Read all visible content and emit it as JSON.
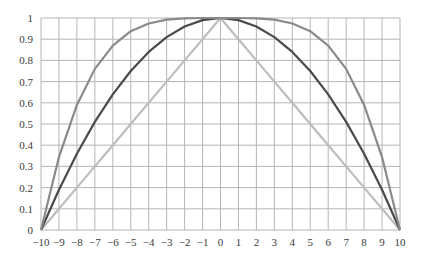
{
  "chart_data": {
    "type": "line",
    "title": "",
    "xlabel": "",
    "ylabel": "",
    "xlim": [
      -10,
      10
    ],
    "ylim": [
      0,
      1
    ],
    "grid": true,
    "legend": null,
    "x": [
      -10,
      -9,
      -8,
      -7,
      -6,
      -5,
      -4,
      -3,
      -2,
      -1,
      0,
      1,
      2,
      3,
      4,
      5,
      6,
      7,
      8,
      9,
      10
    ],
    "x_ticks": [
      "−10",
      "−9",
      "−8",
      "−7",
      "−6",
      "−5",
      "−4",
      "−3",
      "−2",
      "−1",
      "0",
      "1",
      "2",
      "3",
      "4",
      "5",
      "6",
      "7",
      "8",
      "9",
      "10"
    ],
    "y_ticks": [
      "0",
      "0.1",
      "0.2",
      "0.3",
      "0.4",
      "0.5",
      "0.6",
      "0.7",
      "0.8",
      "0.9",
      "1"
    ],
    "series": [
      {
        "name": "outer curve (1 − (x/10)^4)",
        "color": "#8a8a8a",
        "values": [
          0,
          0.344,
          0.59,
          0.76,
          0.87,
          0.938,
          0.974,
          0.992,
          0.998,
          1.0,
          1.0,
          1.0,
          0.998,
          0.992,
          0.974,
          0.938,
          0.87,
          0.76,
          0.59,
          0.344,
          0
        ]
      },
      {
        "name": "middle curve (1 − (x/10)^2)",
        "color": "#4a4a4a",
        "values": [
          0,
          0.19,
          0.36,
          0.51,
          0.64,
          0.75,
          0.84,
          0.91,
          0.96,
          0.99,
          1.0,
          0.99,
          0.96,
          0.91,
          0.84,
          0.75,
          0.64,
          0.51,
          0.36,
          0.19,
          0
        ]
      },
      {
        "name": "inner triangle (1 − |x|/10)",
        "color": "#bdbdbd",
        "values": [
          0,
          0.1,
          0.2,
          0.3,
          0.4,
          0.5,
          0.6,
          0.7,
          0.8,
          0.9,
          1.0,
          0.9,
          0.8,
          0.7,
          0.6,
          0.5,
          0.4,
          0.3,
          0.2,
          0.1,
          0
        ]
      }
    ]
  },
  "style": {
    "grid_color": "#b5b5b5",
    "axis_color": "#7a7a7a",
    "plot": {
      "left": 41,
      "right": 400,
      "top": 18,
      "bottom": 230
    }
  }
}
